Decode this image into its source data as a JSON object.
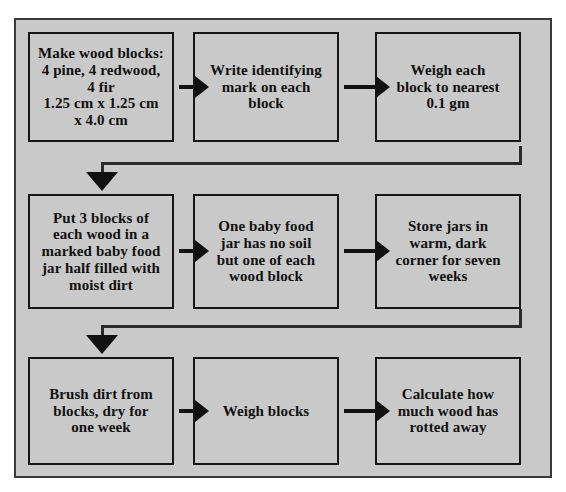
{
  "document": {
    "type": "flowchart",
    "title": "Wood rot experiment procedure flowchart",
    "orientation": "left-to-right, wrapping rows",
    "background_color": "#c9c9c9",
    "border_color": "#3a3a3a",
    "box_fill_color": "#c9c9c9",
    "box_border_color": "#151515",
    "shadow_color": "#1a1a1a",
    "arrow_color": "#111111"
  },
  "rows": [
    {
      "id": "row-1",
      "boxes": [
        {
          "id": "step-1",
          "text": "Make wood blocks:\n4 pine, 4 redwood,\n4 fir\n1.25 cm x 1.25 cm\nx 4.0 cm"
        },
        {
          "id": "step-2",
          "text": "Write identifying\nmark on each\nblock"
        },
        {
          "id": "step-3",
          "text": "Weigh each\nblock to nearest\n0.1 gm"
        }
      ]
    },
    {
      "id": "row-2",
      "boxes": [
        {
          "id": "step-4",
          "text": "Put 3 blocks of\neach wood in a\nmarked baby food\njar half filled with\nmoist dirt"
        },
        {
          "id": "step-5",
          "text": "One baby food\njar has no soil\nbut one of each\nwood block"
        },
        {
          "id": "step-6",
          "text": "Store jars in\nwarm, dark\ncorner for seven\nweeks"
        }
      ]
    },
    {
      "id": "row-3",
      "boxes": [
        {
          "id": "step-7",
          "text": "Brush dirt from\nblocks, dry for\none week"
        },
        {
          "id": "step-8",
          "text": "Weigh blocks"
        },
        {
          "id": "step-9",
          "text": "Calculate how\nmuch wood has\nrotted away"
        }
      ]
    }
  ],
  "connectors": {
    "horizontal_arrow_icon": "arrow-right-icon",
    "wrap_arrow_icon": "arrow-down-icon"
  }
}
